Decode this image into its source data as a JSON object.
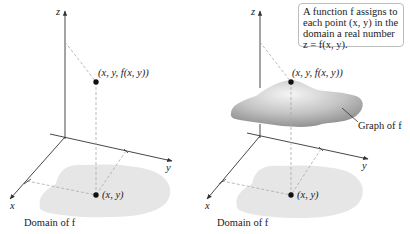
{
  "left_panel": {
    "axis_labels": {
      "z": "z",
      "y": "y",
      "x": "x"
    },
    "point_3d_label": "(x, y, f(x, y))",
    "point_2d_label": "(x, y)",
    "domain_caption": "Domain of f"
  },
  "right_panel": {
    "axis_labels": {
      "z": "z",
      "y": "y",
      "x": "x"
    },
    "point_3d_label": "(x, y, f(x, y))",
    "point_2d_label": "(x, y)",
    "domain_caption": "Domain of f",
    "graph_caption": "Graph of f",
    "callout_lines": [
      "A function f assigns to",
      "each point (x, y) in the",
      "domain a real number",
      "z = f(x, y)."
    ]
  },
  "colors": {
    "domain_fill": "#e6e6e6",
    "surface_light": "#f4f4f4",
    "surface_dark": "#8a8a8a",
    "axis": "#333333",
    "dashed": "#aaaaaa",
    "point": "#111111",
    "callout_border": "#bdbdbd"
  }
}
